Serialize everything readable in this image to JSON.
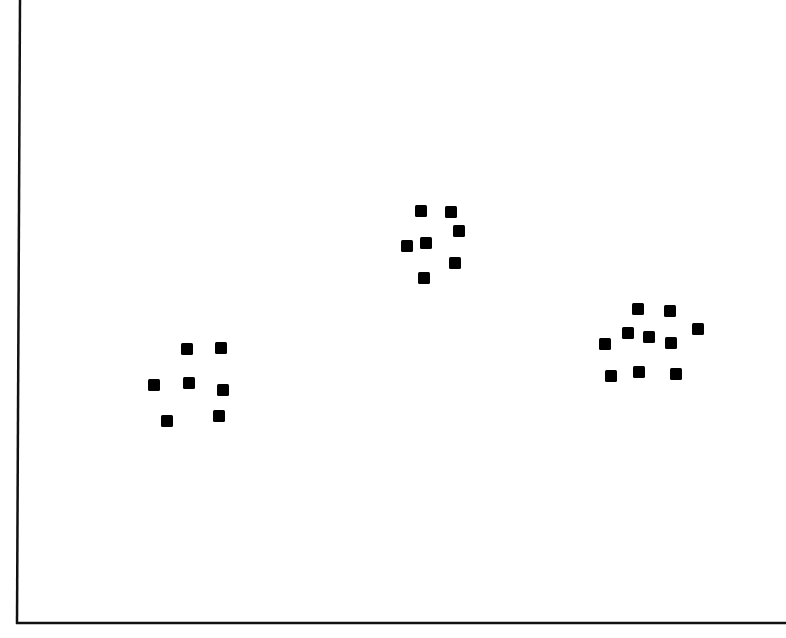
{
  "chart_data": {
    "type": "scatter",
    "title": "",
    "xlabel": "",
    "ylabel": "",
    "grid": false,
    "legend": null,
    "axis_ranges_px": {
      "x": [
        18,
        786
      ],
      "y": [
        0,
        624
      ]
    },
    "note": "No tick labels shown; coordinates in pixel units (y measured downward from top).",
    "series": [
      {
        "name": "cluster-1",
        "points": [
          {
            "x": 187,
            "y": 349
          },
          {
            "x": 221,
            "y": 348
          },
          {
            "x": 154,
            "y": 385
          },
          {
            "x": 189,
            "y": 383
          },
          {
            "x": 223,
            "y": 390
          },
          {
            "x": 167,
            "y": 421
          },
          {
            "x": 219,
            "y": 416
          }
        ]
      },
      {
        "name": "cluster-2",
        "points": [
          {
            "x": 421,
            "y": 211
          },
          {
            "x": 451,
            "y": 212
          },
          {
            "x": 459,
            "y": 231
          },
          {
            "x": 407,
            "y": 246
          },
          {
            "x": 426,
            "y": 243
          },
          {
            "x": 455,
            "y": 263
          },
          {
            "x": 424,
            "y": 278
          }
        ]
      },
      {
        "name": "cluster-3",
        "points": [
          {
            "x": 638,
            "y": 309
          },
          {
            "x": 670,
            "y": 311
          },
          {
            "x": 698,
            "y": 329
          },
          {
            "x": 628,
            "y": 333
          },
          {
            "x": 649,
            "y": 337
          },
          {
            "x": 671,
            "y": 343
          },
          {
            "x": 605,
            "y": 344
          },
          {
            "x": 611,
            "y": 376
          },
          {
            "x": 639,
            "y": 372
          },
          {
            "x": 676,
            "y": 374
          }
        ]
      }
    ],
    "marker": {
      "shape": "square",
      "size": 12,
      "color": "#000000"
    }
  },
  "colors": {
    "axis": "#111111",
    "marker": "#000000",
    "background": "#ffffff"
  }
}
